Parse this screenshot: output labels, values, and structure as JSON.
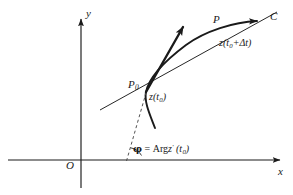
{
  "figure": {
    "background_color": "#ffffff",
    "line_color": "#1a1a1a",
    "axes": {
      "x_label": "x",
      "y_label": "y",
      "origin_label": "O",
      "x_axis": {
        "x1": 8,
        "y1": 160,
        "x2": 285,
        "y2": 160
      },
      "y_axis": {
        "x1": 81,
        "y1": 188,
        "x2": 81,
        "y2": 14
      }
    },
    "points": {
      "P0_label": "P",
      "P0_sub": "0",
      "P0_at": {
        "x": 146,
        "y": 92
      },
      "P_label": "P",
      "P_at": {
        "x": 216,
        "y": 29
      }
    },
    "annotations": {
      "z_t0": {
        "base": "z(t",
        "sub": "0",
        "tail": ")"
      },
      "z_t0_dt": {
        "base": "z(t",
        "sub": "0",
        "tail": "+Δt)"
      },
      "curve_label": "C",
      "angle_expr": {
        "phi": "φ",
        "equals": " = ",
        "arg": "Arg",
        "z": "z",
        "prime": "′",
        "arg_open": " (t",
        "arg_sub": "0",
        "arg_close": ")"
      }
    },
    "curves": {
      "curve_C": {
        "name": "curve-C",
        "path": "M 155 128 C 150 116 144 102 146 92 C 149 76 166 60 186 45 C 206 30 236 21 262 21",
        "stroke_width": 1.9
      },
      "tangent_vector": {
        "name": "tangent-vector-arrow",
        "x1": 146,
        "y1": 92,
        "x2": 185,
        "y2": 24,
        "stroke_width": 2.3
      },
      "secant_line": {
        "name": "secant-line",
        "x1": 100,
        "y1": 110,
        "x2": 276,
        "y2": 12,
        "stroke_width": 1.0
      },
      "dashed_line": {
        "name": "dashed-angle-ray",
        "x1": 127,
        "y1": 161,
        "x2": 146,
        "y2": 93,
        "stroke_width": 1.0,
        "dash": "3 2.6"
      },
      "angle_arc": {
        "name": "angle-arc",
        "path": "M 141 155 A 15 15 0 0 0 131.2 148.4",
        "stroke_width": 0.9
      },
      "curve_arrow_head_at": {
        "x": 262,
        "y": 21
      }
    }
  }
}
